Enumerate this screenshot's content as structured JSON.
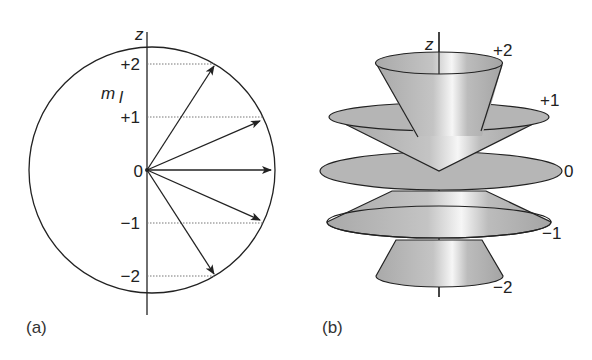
{
  "figure": {
    "panels": [
      {
        "id": "a",
        "label": "(a)",
        "axis_label": "z",
        "quantity_symbol": "m",
        "quantity_subscript": "l",
        "tick_labels": [
          "+2",
          "+1",
          "0",
          "−1",
          "−2"
        ],
        "description": "Vector model: circle with angular momentum vectors from origin, dotted projections onto z axis"
      },
      {
        "id": "b",
        "label": "(b)",
        "axis_label": "z",
        "cone_labels": [
          "+2",
          "+1",
          "0",
          "−1",
          "−2"
        ],
        "description": "Precession cones for each m_l value stacked along z axis"
      }
    ],
    "colors": {
      "line": "#222222",
      "fill_gray": "#b8b8b8",
      "highlight": "#f4f4f4",
      "dotted": "#777777"
    }
  }
}
